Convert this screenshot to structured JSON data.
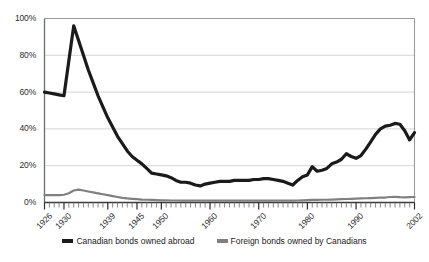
{
  "chart_data": {
    "type": "line",
    "title": "",
    "subtitle": "",
    "xlabel": "",
    "ylabel": "",
    "xlim": [
      1926,
      2002
    ],
    "ylim": [
      0,
      100
    ],
    "grid": true,
    "legend_position": "bottom",
    "y_ticks": [
      "0%",
      "20%",
      "40%",
      "60%",
      "80%",
      "100%"
    ],
    "y_tick_values": [
      0,
      20,
      40,
      60,
      80,
      100
    ],
    "x_ticks": [
      "1926",
      "1930",
      "1939",
      "1945",
      "1950",
      "1960",
      "1970",
      "1980",
      "1990",
      "2002"
    ],
    "x_tick_values": [
      1926,
      1930,
      1939,
      1945,
      1950,
      1960,
      1970,
      1980,
      1990,
      2002
    ],
    "x": [
      1926,
      1927,
      1928,
      1929,
      1930,
      1931,
      1932,
      1933,
      1934,
      1935,
      1936,
      1937,
      1938,
      1939,
      1940,
      1941,
      1942,
      1943,
      1944,
      1945,
      1946,
      1947,
      1948,
      1949,
      1950,
      1951,
      1952,
      1953,
      1954,
      1955,
      1956,
      1957,
      1958,
      1959,
      1960,
      1961,
      1962,
      1963,
      1964,
      1965,
      1966,
      1967,
      1968,
      1969,
      1970,
      1971,
      1972,
      1973,
      1974,
      1975,
      1976,
      1977,
      1978,
      1979,
      1980,
      1981,
      1982,
      1983,
      1984,
      1985,
      1986,
      1987,
      1988,
      1989,
      1990,
      1991,
      1992,
      1993,
      1994,
      1995,
      1996,
      1997,
      1998,
      1999,
      2000,
      2001,
      2002
    ],
    "series": [
      {
        "name": "Canadian bonds owned abroad",
        "color": "#1a1a1a",
        "values": [
          60,
          59.5,
          59,
          58.5,
          58,
          77,
          96,
          88,
          80,
          72,
          65,
          58,
          52,
          46,
          41,
          36,
          32,
          28,
          25,
          23,
          21,
          18.5,
          16,
          15.5,
          15,
          14.5,
          13.5,
          12,
          11,
          11,
          10.5,
          9.5,
          9,
          10,
          10.5,
          11,
          11.5,
          11.5,
          11.5,
          12,
          12,
          12,
          12,
          12.5,
          12.5,
          13,
          13,
          12.5,
          12,
          11.5,
          10.5,
          9.5,
          12,
          14,
          15,
          19.5,
          17,
          17.5,
          18.5,
          21,
          22,
          23.5,
          26.5,
          25,
          24,
          25.5,
          29,
          33,
          37,
          40,
          41.5,
          42,
          43,
          42.5,
          39,
          34,
          38
        ]
      },
      {
        "name": "Foreign bonds owned by Canadians",
        "color": "#808080",
        "values": [
          4,
          4,
          4,
          4,
          4.2,
          5,
          6.5,
          7,
          6.5,
          6,
          5.5,
          5,
          4.5,
          4,
          3.5,
          3,
          2.5,
          2.2,
          2,
          1.8,
          1.6,
          1.5,
          1.4,
          1.3,
          1.2,
          1.2,
          1.1,
          1.1,
          1,
          1,
          1,
          1,
          1,
          1,
          1,
          1,
          1,
          1,
          1,
          1,
          1,
          1,
          1,
          1,
          1,
          1,
          1,
          1,
          1,
          1,
          1,
          1,
          1.1,
          1.2,
          1.3,
          1.4,
          1.4,
          1.5,
          1.5,
          1.6,
          1.7,
          1.8,
          1.9,
          2,
          2.1,
          2.2,
          2.3,
          2.4,
          2.5,
          2.6,
          2.7,
          3,
          3.1,
          2.9,
          2.8,
          2.9,
          3
        ]
      }
    ],
    "legend": [
      {
        "label": "Canadian bonds owned abroad",
        "color": "#1a1a1a"
      },
      {
        "label": "Foreign bonds owned by Canadians",
        "color": "#808080"
      }
    ]
  }
}
